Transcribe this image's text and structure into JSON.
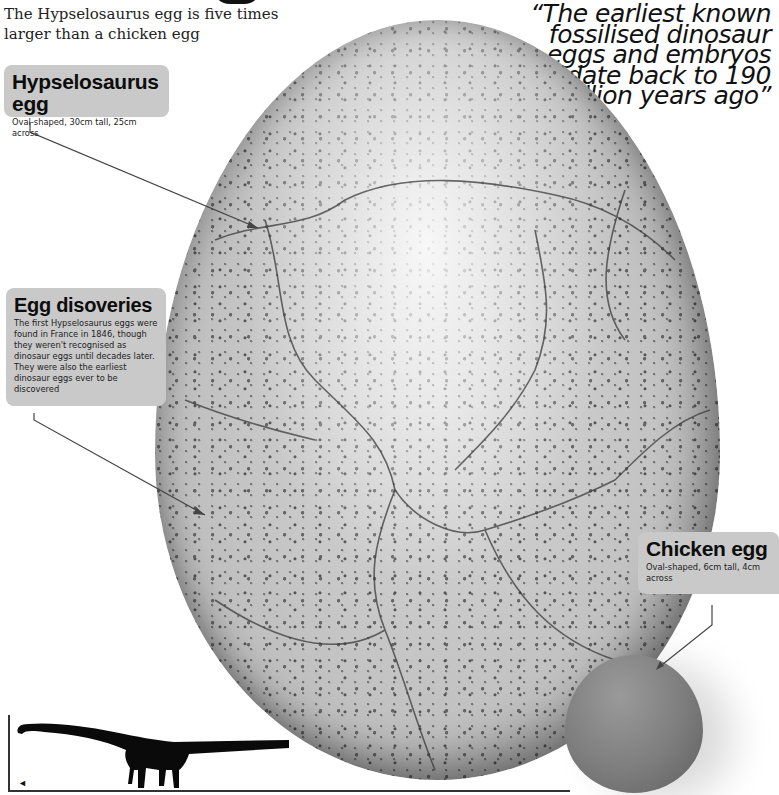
{
  "intro": {
    "text": "The Hypselosaurus egg is five times larger than a chicken egg"
  },
  "quote": {
    "text": "“The earliest known fossilised dinosaur eggs and embryos date back to 190 million years ago”"
  },
  "labels": {
    "hypselosaurus": {
      "title": "Hypselosaurus egg",
      "desc": "Oval-shaped, 30cm tall, 25cm across"
    },
    "discoveries": {
      "title": "Egg disoveries",
      "desc": "The first Hypselosaurus eggs were found in France in 1846, though they weren't recognised as dinosaur eggs until decades later. They were also the earliest dinosaur eggs ever to be discovered"
    },
    "chicken": {
      "title": "Chicken egg",
      "desc": "Oval-shaped, 6cm tall, 4cm across"
    }
  },
  "icons": {
    "dinosaur": "sauropod-silhouette",
    "chicken": "chicken-silhouette"
  },
  "colors": {
    "label_bg": "#c9c9c9",
    "text": "#111111",
    "leader_line": "#444444"
  }
}
